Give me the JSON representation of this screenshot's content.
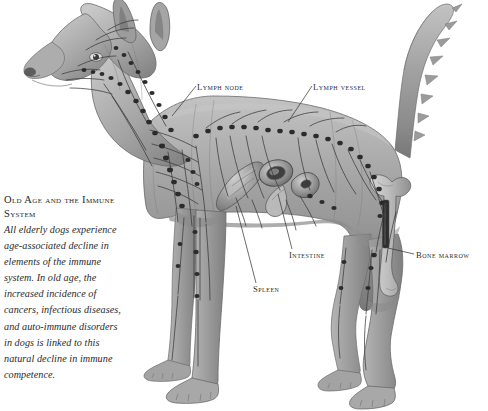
{
  "figure": {
    "style": "grayscale engraving illustration",
    "background_color": "#ffffff",
    "body_tone": "#9a9a9a",
    "line_color": "#2c2c2c"
  },
  "sidebar": {
    "heading": "Old Age and the Immune System",
    "paragraph": "All elderly dogs experience age-associated decline in elements of the immune system. In old age, the increased incidence of cancers, infectious diseases, and auto-immune disorders in dogs is linked to this natural decline in immune competence."
  },
  "labels": [
    {
      "id": "lymph-node",
      "text": "Lymph node",
      "x": 197,
      "y": 82
    },
    {
      "id": "lymph-vessel",
      "text": "Lymph vessel",
      "x": 313,
      "y": 82
    },
    {
      "id": "intestine",
      "text": "Intestine",
      "x": 289,
      "y": 250
    },
    {
      "id": "bone-marrow",
      "text": "Bone marrow",
      "x": 416,
      "y": 250
    },
    {
      "id": "spleen",
      "text": "Spleen",
      "x": 253,
      "y": 284
    }
  ],
  "anatomy": {
    "organs": [
      "spleen",
      "intestine",
      "bone marrow"
    ],
    "networks": [
      "lymph vessels",
      "lymph nodes"
    ]
  }
}
